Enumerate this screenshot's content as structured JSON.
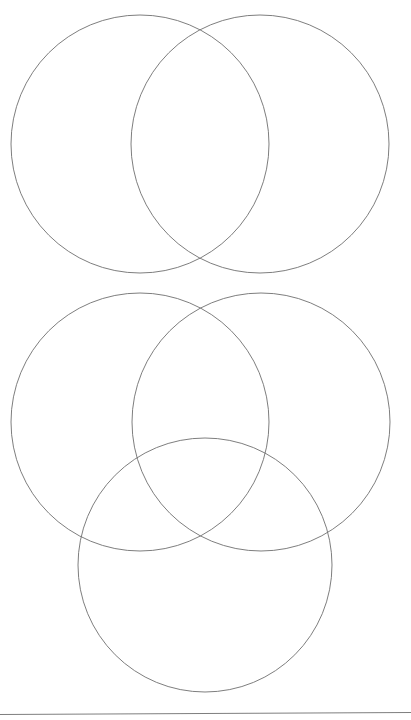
{
  "document": {
    "title": "Venn Diagram Worksheet",
    "background_color": "#ffffff",
    "width": 411,
    "height": 720
  },
  "style": {
    "stroke_color": "#6f6f6f",
    "stroke_width": 0.9,
    "fill": "none"
  },
  "diagrams": [
    {
      "name": "two-set-venn-diagram",
      "label": "Two-circle Venn diagram",
      "circle_count": 2,
      "circles": [
        {
          "name": "left-circle",
          "label": "Set A",
          "cx": 140,
          "cy": 144,
          "r": 129
        },
        {
          "name": "right-circle",
          "label": "Set B",
          "cx": 260,
          "cy": 144,
          "r": 129
        }
      ],
      "regions": [
        "A only",
        "A and B",
        "B only"
      ]
    },
    {
      "name": "three-set-venn-diagram",
      "label": "Three-circle Venn diagram",
      "circle_count": 3,
      "circles": [
        {
          "name": "upper-left-circle",
          "label": "Set A",
          "cx": 140,
          "cy": 422,
          "r": 129
        },
        {
          "name": "upper-right-circle",
          "label": "Set B",
          "cx": 261,
          "cy": 422,
          "r": 129
        },
        {
          "name": "bottom-circle",
          "label": "Set C",
          "cx": 205,
          "cy": 565,
          "r": 127
        }
      ],
      "regions": [
        "A only",
        "B only",
        "C only",
        "A and B",
        "A and C",
        "B and C",
        "A and B and C"
      ]
    }
  ],
  "footer": {
    "rule": {
      "name": "footer-rule",
      "x1": 0,
      "y1": 714.5,
      "x2": 411,
      "y2": 712.5
    },
    "page_number": ""
  }
}
